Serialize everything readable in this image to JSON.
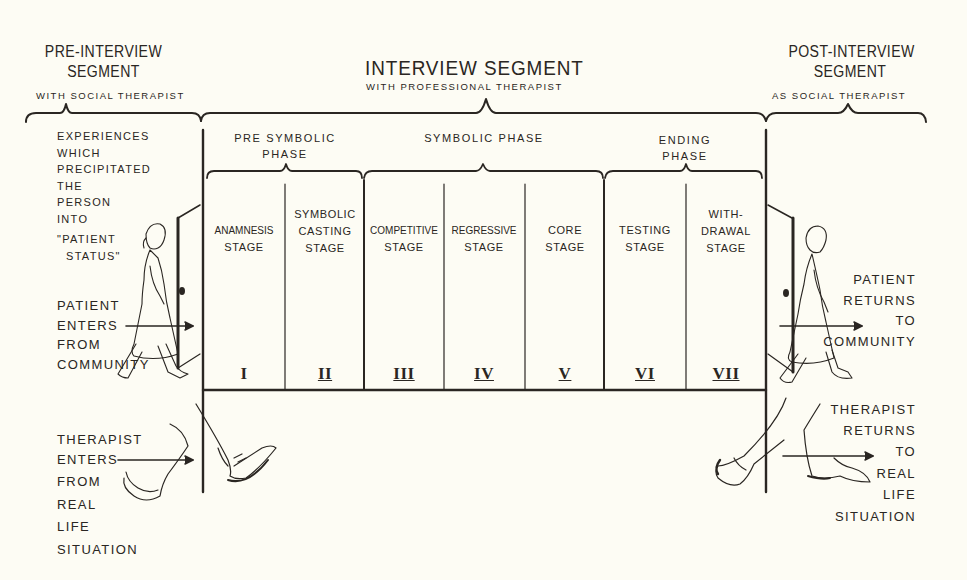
{
  "diagram": {
    "segments": [
      {
        "id": "pre",
        "title_lines": [
          "PRE-INTERVIEW",
          "SEGMENT"
        ],
        "subtitle": "WITH  SOCIAL  THERAPIST"
      },
      {
        "id": "interview",
        "title": "INTERVIEW   SEGMENT",
        "subtitle": "WITH   PROFESSIONAL   THERAPIST"
      },
      {
        "id": "post",
        "title_lines": [
          "POST-INTERVIEW",
          "SEGMENT"
        ],
        "subtitle": "AS  SOCIAL   THERAPIST"
      }
    ],
    "phases": [
      {
        "id": "pre-symbolic",
        "lines": [
          "PRE  SYMBOLIC",
          "PHASE"
        ]
      },
      {
        "id": "symbolic",
        "lines": [
          "SYMBOLIC  PHASE"
        ]
      },
      {
        "id": "ending",
        "lines": [
          "ENDING",
          "PHASE"
        ]
      }
    ],
    "stages": [
      {
        "lines": [
          "ANAMNESIS",
          "STAGE"
        ],
        "numeral": "I"
      },
      {
        "lines": [
          "SYMBOLIC",
          "CASTING",
          "STAGE"
        ],
        "numeral": "II"
      },
      {
        "lines": [
          "COMPETITIVE",
          "STAGE"
        ],
        "numeral": "III"
      },
      {
        "lines": [
          "REGRESSIVE",
          "STAGE"
        ],
        "numeral": "IV"
      },
      {
        "lines": [
          "CORE",
          "STAGE"
        ],
        "numeral": "V"
      },
      {
        "lines": [
          "TESTING",
          "STAGE"
        ],
        "numeral": "VI"
      },
      {
        "lines": [
          "WITH-",
          "DRAWAL",
          "STAGE"
        ],
        "numeral": "VII"
      }
    ],
    "left_notes": {
      "experiences": [
        "EXPERIENCES",
        "WHICH",
        "PRECIPITATED",
        "THE",
        "PERSON",
        "INTO",
        "\"PATIENT",
        "STATUS\""
      ],
      "patient_enters": [
        "PATIENT",
        "ENTERS",
        "FROM",
        "COMMUNITY"
      ],
      "therapist_enters": [
        "THERAPIST",
        "ENTERS",
        "FROM",
        "REAL",
        "LIFE",
        "SITUATION"
      ]
    },
    "right_notes": {
      "patient_returns": [
        "PATIENT",
        "RETURNS",
        "TO",
        "COMMUNITY"
      ],
      "therapist_returns": [
        "THERAPIST",
        "RETURNS",
        "TO",
        "REAL",
        "LIFE",
        "SITUATION"
      ]
    },
    "figures": [
      {
        "name": "patient-walking-in-icon",
        "desc": "woman walking through door"
      },
      {
        "name": "patient-walking-out-icon",
        "desc": "woman walking out door"
      },
      {
        "name": "therapist-legs-in-icon",
        "desc": "legs stepping in"
      },
      {
        "name": "therapist-legs-out-icon",
        "desc": "legs stepping out"
      }
    ],
    "colors": {
      "ink": "#2a2622",
      "paper": "#fdfcf4"
    }
  }
}
